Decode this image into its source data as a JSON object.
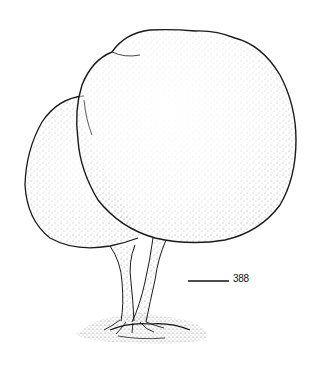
{
  "figure": {
    "style": "stippled black-and-white illustration",
    "ink_color": "#1a1a1a",
    "background": "#ffffff"
  },
  "scale_bar": {
    "label": "388"
  }
}
